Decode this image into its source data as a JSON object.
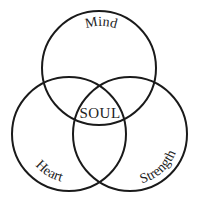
{
  "diagram": {
    "type": "venn",
    "circles": [
      {
        "id": "mind",
        "label": "Mind",
        "cx": 99,
        "cy": 68,
        "r": 57
      },
      {
        "id": "heart",
        "label": "Heart",
        "cx": 69,
        "cy": 134,
        "r": 57
      },
      {
        "id": "strength",
        "label": "Strength",
        "cx": 130,
        "cy": 134,
        "r": 57
      }
    ],
    "center_label": "SOUL",
    "stroke_color": "#1a1a1a",
    "text_color": "#222222"
  }
}
